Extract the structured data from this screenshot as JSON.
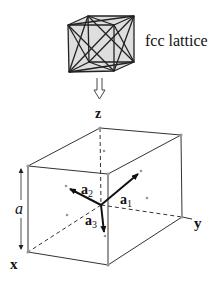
{
  "figure": {
    "top_label": "fcc lattice",
    "axes": {
      "x": "x",
      "y": "y",
      "z": "z"
    },
    "vectors": [
      {
        "name": "a",
        "sub": "1"
      },
      {
        "name": "a",
        "sub": "2"
      },
      {
        "name": "a",
        "sub": "3"
      }
    ],
    "edge_length_label": "a",
    "colors": {
      "line": "#333333",
      "dot": "#999999",
      "cube_fill": "#dcdcdc"
    }
  }
}
